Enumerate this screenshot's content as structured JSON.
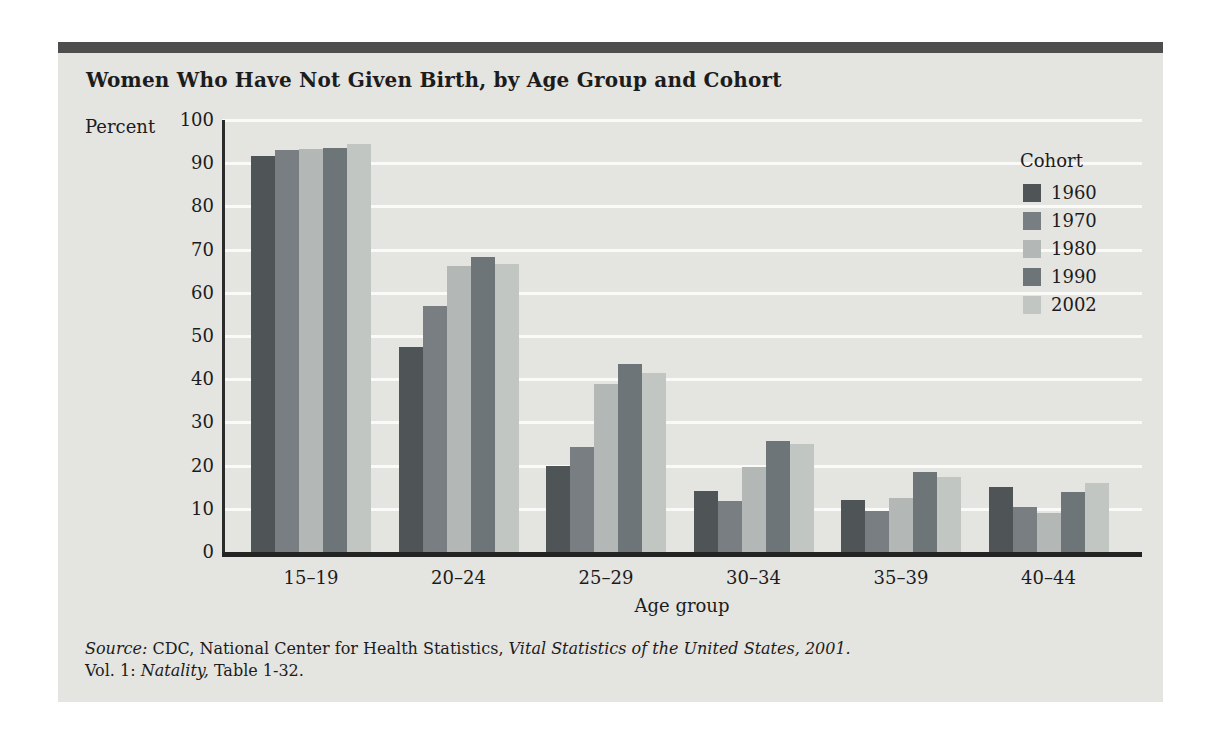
{
  "figure": {
    "title": "Women Who Have Not Given Birth, by Age Group and Cohort"
  },
  "chart_data": {
    "type": "bar",
    "title": "Women Who Have Not Given Birth, by Age Group and Cohort",
    "xlabel": "Age group",
    "ylabel": "Percent",
    "ylim": [
      0,
      100
    ],
    "yticks": [
      0,
      10,
      20,
      30,
      40,
      50,
      60,
      70,
      80,
      90,
      100
    ],
    "grid": true,
    "legend_title": "Cohort",
    "legend_position": "right-inside",
    "categories": [
      "15–19",
      "20–24",
      "25–29",
      "30–34",
      "35–39",
      "40–44"
    ],
    "series": [
      {
        "name": "1960",
        "color": "#4f5557",
        "values": [
          91.6,
          47.5,
          19.8,
          14.2,
          12.1,
          15.1
        ]
      },
      {
        "name": "1970",
        "color": "#787e81",
        "values": [
          93.0,
          57.0,
          24.4,
          11.8,
          9.4,
          10.4
        ]
      },
      {
        "name": "1980",
        "color": "#b3b8b6",
        "values": [
          93.4,
          66.2,
          38.9,
          19.7,
          12.5,
          9.0
        ]
      },
      {
        "name": "1990",
        "color": "#6e7578",
        "values": [
          93.5,
          68.3,
          43.5,
          25.7,
          18.5,
          13.9
        ]
      },
      {
        "name": "2002",
        "color": "#c2c6c3",
        "values": [
          94.5,
          66.7,
          41.4,
          24.9,
          17.3,
          15.9
        ]
      }
    ]
  },
  "source": {
    "line1": [
      {
        "text": "Source:",
        "italic": true
      },
      {
        "text": " CDC, National Center for Health Statistics, ",
        "italic": false
      },
      {
        "text": "Vital Statistics of the United States, 2001.",
        "italic": true
      }
    ],
    "line2": [
      {
        "text": "Vol. 1: ",
        "italic": false
      },
      {
        "text": "Natality,",
        "italic": true
      },
      {
        "text": " Table 1-32.",
        "italic": false
      }
    ]
  },
  "colors": {
    "page_bg": "#ffffff",
    "panel_bg": "#e4e4e1",
    "top_bar": "#4e4e4e",
    "gridline": "#fafaf8",
    "axis": "#2b2b2b",
    "text": "#1c1c1c"
  }
}
